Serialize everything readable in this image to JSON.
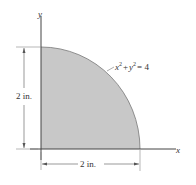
{
  "figure": {
    "region": {
      "fill": "#c8c8c8",
      "equation": {
        "x_var": "x",
        "x_exp": "2",
        "plus": "+",
        "y_var": "y",
        "y_exp": "2",
        "equals": "= 4"
      }
    },
    "axes": {
      "x_label": "x",
      "y_label": "y"
    },
    "dimensions": {
      "height_label": "2 in.",
      "width_label": "2 in."
    }
  }
}
